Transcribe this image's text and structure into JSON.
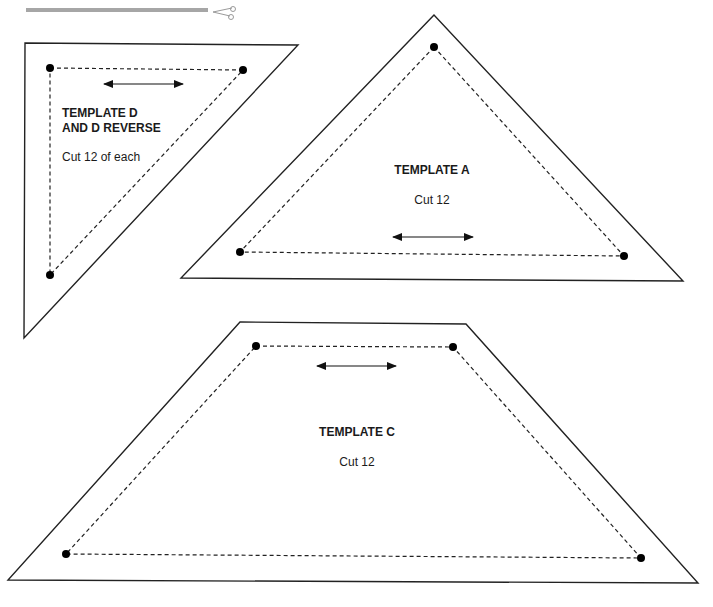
{
  "cut_line": {
    "color": "#a6a6a6",
    "icon": "scissors-icon"
  },
  "templates": {
    "d": {
      "title_line1": "TEMPLATE D",
      "title_line2": "AND D REVERSE",
      "instruction": "Cut 12 of each",
      "grainline": "double-arrow"
    },
    "a": {
      "title": "TEMPLATE A",
      "instruction": "Cut 12",
      "grainline": "double-arrow"
    },
    "c": {
      "title": "TEMPLATE C",
      "instruction": "Cut 12",
      "grainline": "double-arrow"
    }
  },
  "legend": {
    "cutting_line": "solid outline",
    "sewing_line": "dashed line",
    "corner_marks": "dots"
  }
}
